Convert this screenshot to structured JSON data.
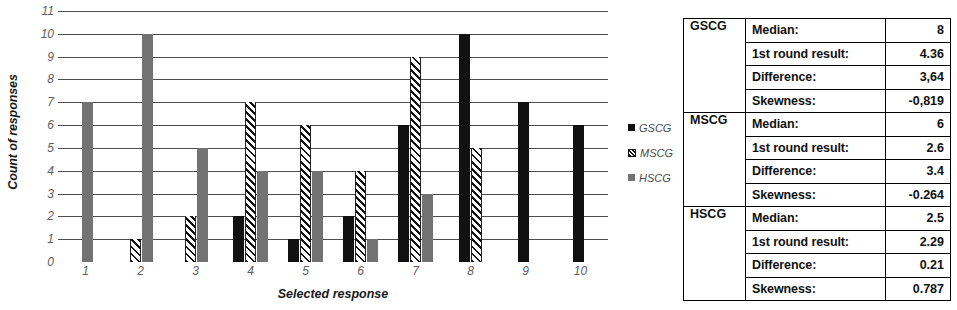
{
  "chart_data": {
    "type": "bar",
    "title": "",
    "xlabel": "Selected response",
    "ylabel": "Count of responses",
    "categories": [
      "1",
      "2",
      "3",
      "4",
      "5",
      "6",
      "7",
      "8",
      "9",
      "10"
    ],
    "ylim": [
      0,
      11
    ],
    "yticks": [
      0,
      1,
      2,
      3,
      4,
      5,
      6,
      7,
      8,
      9,
      10,
      11
    ],
    "grid": true,
    "legend_position": "right",
    "series": [
      {
        "name": "GSCG",
        "color": "#111111",
        "pattern": "solid",
        "values": [
          0,
          0,
          0,
          2,
          1,
          2,
          6,
          10,
          7,
          6
        ]
      },
      {
        "name": "MSCG",
        "color": "#111111",
        "pattern": "diagonal-hatch",
        "values": [
          0,
          1,
          2,
          7,
          6,
          4,
          9,
          5,
          0,
          0
        ]
      },
      {
        "name": "HSCG",
        "color": "#737373",
        "pattern": "solid",
        "values": [
          7,
          10,
          5,
          4,
          4,
          1,
          3,
          0,
          0,
          0
        ]
      }
    ]
  },
  "legend": {
    "items": [
      {
        "label": "GSCG",
        "swatch": "gscg"
      },
      {
        "label": "MSCG",
        "swatch": "mscg"
      },
      {
        "label": "HSCG",
        "swatch": "hscg"
      }
    ]
  },
  "stats_table": {
    "rows": [
      {
        "group": "GSCG",
        "label": "Median:",
        "value": "8"
      },
      {
        "group": "",
        "label": "1st round result:",
        "value": "4.36"
      },
      {
        "group": "",
        "label": "Difference:",
        "value": "3,64"
      },
      {
        "group": "",
        "label": "Skewness:",
        "value": "-0,819"
      },
      {
        "group": "MSCG",
        "label": "Median:",
        "value": "6"
      },
      {
        "group": "",
        "label": "1st round result:",
        "value": "2.6"
      },
      {
        "group": "",
        "label": "Difference:",
        "value": "3.4"
      },
      {
        "group": "",
        "label": "Skewness:",
        "value": "-0.264"
      },
      {
        "group": "HSCG",
        "label": "Median:",
        "value": "2.5"
      },
      {
        "group": "",
        "label": "1st round result:",
        "value": "2.29"
      },
      {
        "group": "",
        "label": "Difference:",
        "value": "0.21"
      },
      {
        "group": "",
        "label": "Skewness:",
        "value": "0.787"
      }
    ]
  }
}
